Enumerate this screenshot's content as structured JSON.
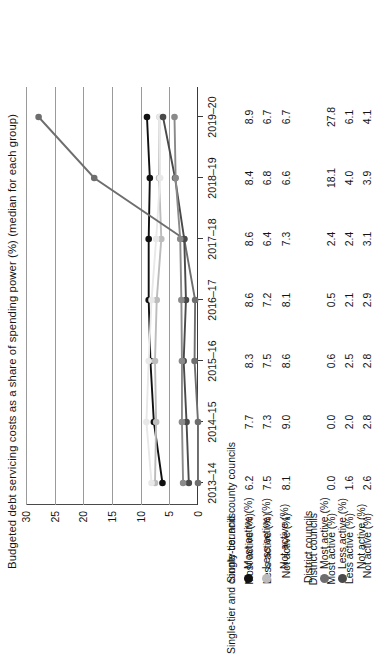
{
  "chart_data": {
    "type": "line",
    "title": "Budgeted debt servicing costs as a share of spending power (%) (median for each group)",
    "xlabel": "",
    "ylabel": "",
    "categories": [
      "2013–14",
      "2014–15",
      "2015–16",
      "2016–17",
      "2017–18",
      "2018–19",
      "2019–20"
    ],
    "ylim": [
      0,
      30
    ],
    "yticks": [
      0,
      5,
      10,
      15,
      20,
      25,
      30
    ],
    "ytick_labels": [
      "0",
      "5",
      "10",
      "15",
      "20",
      "25",
      "30"
    ],
    "grid": true,
    "legend_position": "bottom-left",
    "series": [
      {
        "name": "Most active (%)",
        "group": "Single-tier and county councils",
        "color": "#111111",
        "values": [
          6.2,
          7.7,
          8.3,
          8.6,
          8.6,
          8.4,
          8.9
        ]
      },
      {
        "name": "Less active (%)",
        "group": "Single-tier and county councils",
        "color": "#bcbcbc",
        "values": [
          7.5,
          7.3,
          7.5,
          7.2,
          6.4,
          6.8,
          6.7
        ]
      },
      {
        "name": "Not active (%)",
        "group": "Single-tier and county councils",
        "color": "#e8e8e8",
        "values": [
          8.1,
          9.0,
          8.6,
          8.1,
          7.3,
          6.6,
          6.7
        ]
      },
      {
        "name": "Most active (%)",
        "group": "District councils",
        "color": "#6e6e6e",
        "values": [
          0.0,
          0.0,
          0.6,
          0.5,
          2.4,
          18.1,
          27.8
        ]
      },
      {
        "name": "Less active (%)",
        "group": "District councils",
        "color": "#4a4a4a",
        "values": [
          1.6,
          2.0,
          2.5,
          2.1,
          2.4,
          4.0,
          6.1
        ]
      },
      {
        "name": "Not active (%)",
        "group": "District councils",
        "color": "#8a8a8a",
        "values": [
          2.6,
          2.8,
          2.8,
          2.9,
          3.1,
          3.9,
          4.1
        ]
      }
    ]
  },
  "table": {
    "groups": [
      {
        "title": "Single-tier and county councils",
        "rows": [
          {
            "label": "Most active (%)",
            "marker": "#111111",
            "values": [
              "6.2",
              "7.7",
              "8.3",
              "8.6",
              "8.6",
              "8.4",
              "8.9"
            ]
          },
          {
            "label": "Less active (%)",
            "marker": "#bcbcbc",
            "values": [
              "7.5",
              "7.3",
              "7.5",
              "7.2",
              "6.4",
              "6.8",
              "6.7"
            ]
          },
          {
            "label": "Not active (%)",
            "marker": "none",
            "values": [
              "8.1",
              "9.0",
              "8.6",
              "8.1",
              "7.3",
              "6.6",
              "6.7"
            ]
          }
        ]
      },
      {
        "title": "District councils",
        "rows": [
          {
            "label": "Most active (%)",
            "marker": "#6e6e6e",
            "values": [
              "0.0",
              "0.0",
              "0.6",
              "0.5",
              "2.4",
              "18.1",
              "27.8"
            ]
          },
          {
            "label": "Less active (%)",
            "marker": "#4a4a4a",
            "values": [
              "1.6",
              "2.0",
              "2.5",
              "2.1",
              "2.4",
              "4.0",
              "6.1"
            ]
          },
          {
            "label": "Not active (%)",
            "marker": "none",
            "values": [
              "2.6",
              "2.8",
              "2.8",
              "2.9",
              "3.1",
              "3.9",
              "4.1"
            ]
          }
        ]
      }
    ]
  }
}
